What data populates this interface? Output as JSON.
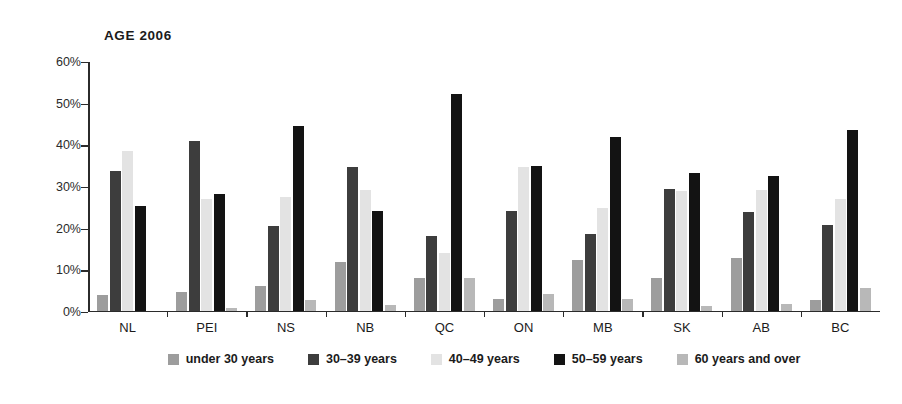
{
  "chart_data": {
    "type": "bar",
    "title": "AGE 2006",
    "xlabel": "",
    "ylabel": "",
    "ylim": [
      0,
      60
    ],
    "ytick_values": [
      0,
      10,
      20,
      30,
      40,
      50,
      60
    ],
    "ytick_labels": [
      "0%",
      "10%",
      "20%",
      "30%",
      "40%",
      "50%",
      "60%"
    ],
    "grid": false,
    "legend_position": "bottom",
    "categories": [
      "NL",
      "PEI",
      "NS",
      "NB",
      "QC",
      "ON",
      "MB",
      "SK",
      "AB",
      "BC"
    ],
    "series": [
      {
        "name": "under 30 years",
        "color": "#9d9d9d",
        "values": [
          3.7,
          4.5,
          5.9,
          11.6,
          7.8,
          2.7,
          12.1,
          7.9,
          12.7,
          2.5
        ]
      },
      {
        "name": "30–39 years",
        "color": "#3d3d3d",
        "values": [
          33.5,
          40.6,
          20.3,
          34.4,
          18.0,
          23.8,
          18.4,
          29.2,
          23.7,
          20.5
        ]
      },
      {
        "name": "40–49 years",
        "color": "#e3e3e3",
        "values": [
          38.3,
          26.7,
          27.3,
          29.0,
          13.8,
          34.4,
          24.5,
          28.6,
          29.0,
          26.7
        ]
      },
      {
        "name": "50–59 years",
        "color": "#131313",
        "values": [
          25.2,
          27.9,
          44.4,
          23.9,
          52.0,
          34.6,
          41.6,
          32.9,
          32.4,
          43.4
        ]
      },
      {
        "name": "60 years and over",
        "color": "#b8b8b8",
        "values": [
          0.0,
          0.5,
          2.6,
          1.4,
          7.7,
          3.9,
          2.7,
          1.2,
          1.6,
          5.5
        ]
      }
    ]
  },
  "legend": {
    "items": [
      {
        "label": "under 30 years",
        "color": "#9d9d9d"
      },
      {
        "label": "30–39 years",
        "color": "#3d3d3d"
      },
      {
        "label": "40–49 years",
        "color": "#e3e3e3"
      },
      {
        "label": "50–59 years",
        "color": "#131313"
      },
      {
        "label": "60 years and over",
        "color": "#b8b8b8"
      }
    ]
  }
}
